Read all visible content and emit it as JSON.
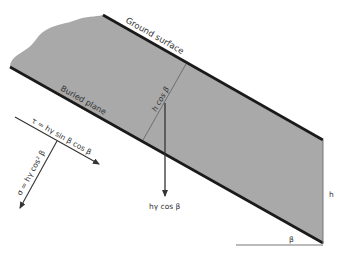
{
  "diagram": {
    "colors": {
      "soil_fill": "#a9a9a9",
      "line": "#1a1a1a",
      "thin_line": "#555555",
      "text": "#333333"
    },
    "labels": {
      "ground_surface": "Ground surface",
      "buried_plane": "Buried plane",
      "perpendicular_depth": "h cos β",
      "vertical_weight": "hγ cos β",
      "shear_stress": "τ = hγ sin β cos β",
      "normal_stress": "σ = hγ cos² β",
      "height": "h",
      "angle": "β"
    }
  }
}
